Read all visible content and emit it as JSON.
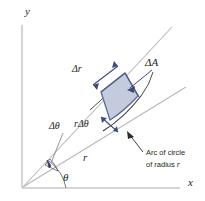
{
  "figure": {
    "axes": {
      "y_label": "y",
      "x_label": "x"
    },
    "labels": {
      "delta_r": "Δr",
      "delta_A": "ΔA",
      "delta_theta": "Δθ",
      "r_delta_theta": "rΔθ",
      "radius": "r",
      "theta": "θ"
    },
    "annotation": {
      "line1": "Arc of circle",
      "line2_prefix": "of radius ",
      "line2_symbol": "r"
    },
    "colors": {
      "axis": "#c8c8c8",
      "ray": "#b5b5b5",
      "element_fill": "#c3cbdc",
      "element_stroke": "#5b6a96",
      "arrow": "#3b4a7a",
      "text": "#231f20",
      "arc": "#2f2f2f"
    }
  }
}
